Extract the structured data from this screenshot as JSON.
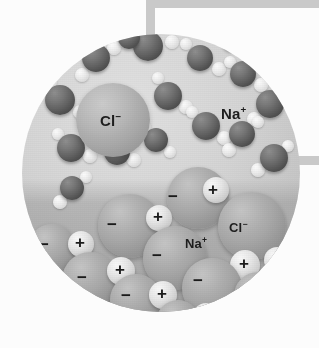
{
  "figure": {
    "kind": "molecular-illustration",
    "background_color": "#ffffff",
    "circle": {
      "fill_color": "#d6d6d3",
      "cx": 161,
      "cy": 173,
      "r": 139
    }
  },
  "connectors": [
    {
      "name": "top-vertical-stem",
      "color": "#c9c9c9"
    },
    {
      "name": "top-horizontal-bar",
      "color": "#c9c9c9"
    },
    {
      "name": "right-tab",
      "color": "#c9c9c9"
    }
  ],
  "labels": [
    {
      "id": "cl-solvated",
      "species": "Cl",
      "charge": "−",
      "text": "Cl",
      "sup": "−",
      "x": 113,
      "y": 120,
      "size": "big",
      "region": "solution"
    },
    {
      "id": "na-solvated",
      "species": "Na",
      "charge": "+",
      "text": "Na",
      "sup": "+",
      "x": 234,
      "y": 113,
      "size": "big",
      "region": "solution"
    },
    {
      "id": "cl-crystal",
      "species": "Cl",
      "charge": "−",
      "text": "Cl",
      "sup": "−",
      "x": 240,
      "y": 228,
      "size": "mid",
      "region": "crystal"
    },
    {
      "id": "na-crystal",
      "species": "Na",
      "charge": "+",
      "text": "Na",
      "sup": "+",
      "x": 196,
      "y": 244,
      "size": "mid",
      "region": "crystal"
    }
  ],
  "charge_marks": [
    {
      "sign": "−",
      "x": 173,
      "y": 197
    },
    {
      "sign": "+",
      "x": 213,
      "y": 190
    },
    {
      "sign": "−",
      "x": 112,
      "y": 225
    },
    {
      "sign": "+",
      "x": 158,
      "y": 217
    },
    {
      "sign": "−",
      "x": 44,
      "y": 245
    },
    {
      "sign": "+",
      "x": 80,
      "y": 243
    },
    {
      "sign": "−",
      "x": 157,
      "y": 256
    },
    {
      "sign": "+",
      "x": 244,
      "y": 264
    },
    {
      "sign": "+",
      "x": 277,
      "y": 259
    },
    {
      "sign": "−",
      "x": 82,
      "y": 278
    },
    {
      "sign": "+",
      "x": 120,
      "y": 270
    },
    {
      "sign": "−",
      "x": 198,
      "y": 281
    },
    {
      "sign": "−",
      "x": 126,
      "y": 296
    },
    {
      "sign": "+",
      "x": 162,
      "y": 294
    },
    {
      "sign": "−",
      "x": 230,
      "y": 303
    },
    {
      "sign": "−",
      "x": 174,
      "y": 320
    },
    {
      "sign": "+",
      "x": 205,
      "y": 315
    }
  ],
  "water_molecules": [
    {
      "ox_x": 148,
      "ox_y": 46,
      "ox_r": 15,
      "h": [
        {
          "x": 172,
          "y": 42,
          "r": 7
        },
        {
          "x": 140,
          "y": 31,
          "r": 7
        }
      ]
    },
    {
      "ox_x": 96,
      "ox_y": 58,
      "ox_r": 14,
      "h": [
        {
          "x": 114,
          "y": 48,
          "r": 7
        },
        {
          "x": 82,
          "y": 75,
          "r": 7
        }
      ]
    },
    {
      "ox_x": 200,
      "ox_y": 58,
      "ox_r": 13,
      "h": [
        {
          "x": 219,
          "y": 69,
          "r": 7
        },
        {
          "x": 186,
          "y": 44,
          "r": 6
        }
      ]
    },
    {
      "ox_x": 243,
      "ox_y": 74,
      "ox_r": 13,
      "h": [
        {
          "x": 261,
          "y": 85,
          "r": 7
        },
        {
          "x": 230,
          "y": 62,
          "r": 6
        }
      ]
    },
    {
      "ox_x": 60,
      "ox_y": 100,
      "ox_r": 15,
      "h": [
        {
          "x": 80,
          "y": 112,
          "r": 7
        },
        {
          "x": 50,
          "y": 82,
          "r": 7
        }
      ]
    },
    {
      "ox_x": 168,
      "ox_y": 96,
      "ox_r": 14,
      "h": [
        {
          "x": 186,
          "y": 107,
          "r": 7
        },
        {
          "x": 158,
          "y": 78,
          "r": 6
        }
      ]
    },
    {
      "ox_x": 270,
      "ox_y": 104,
      "ox_r": 14,
      "h": [
        {
          "x": 254,
          "y": 119,
          "r": 7
        },
        {
          "x": 283,
          "y": 88,
          "r": 6
        }
      ]
    },
    {
      "ox_x": 206,
      "ox_y": 126,
      "ox_r": 14,
      "h": [
        {
          "x": 224,
          "y": 138,
          "r": 7
        },
        {
          "x": 192,
          "y": 112,
          "r": 6
        }
      ]
    },
    {
      "ox_x": 242,
      "ox_y": 134,
      "ox_r": 13,
      "h": [
        {
          "x": 229,
          "y": 150,
          "r": 7
        },
        {
          "x": 258,
          "y": 122,
          "r": 6
        }
      ]
    },
    {
      "ox_x": 71,
      "ox_y": 148,
      "ox_r": 14,
      "h": [
        {
          "x": 90,
          "y": 156,
          "r": 7
        },
        {
          "x": 58,
          "y": 134,
          "r": 6
        }
      ]
    },
    {
      "ox_x": 117,
      "ox_y": 152,
      "ox_r": 13,
      "h": [
        {
          "x": 134,
          "y": 160,
          "r": 7
        },
        {
          "x": 104,
          "y": 138,
          "r": 6
        }
      ]
    },
    {
      "ox_x": 156,
      "ox_y": 140,
      "ox_r": 12,
      "h": [
        {
          "x": 170,
          "y": 152,
          "r": 6
        },
        {
          "x": 145,
          "y": 127,
          "r": 6
        }
      ]
    },
    {
      "ox_x": 274,
      "ox_y": 158,
      "ox_r": 14,
      "h": [
        {
          "x": 258,
          "y": 170,
          "r": 7
        },
        {
          "x": 288,
          "y": 146,
          "r": 6
        }
      ]
    },
    {
      "ox_x": 72,
      "ox_y": 188,
      "ox_r": 12,
      "h": [
        {
          "x": 60,
          "y": 202,
          "r": 7
        },
        {
          "x": 86,
          "y": 177,
          "r": 6
        }
      ]
    },
    {
      "ox_x": 129,
      "ox_y": 38,
      "ox_r": 11,
      "h": [
        {
          "x": 118,
          "y": 29,
          "r": 6
        }
      ]
    },
    {
      "ox_x": 232,
      "ox_y": 40,
      "ox_r": 11,
      "h": [
        {
          "x": 246,
          "y": 49,
          "r": 6
        }
      ]
    }
  ],
  "solvated_ions": [
    {
      "id": "cl-big-sphere",
      "x": 113,
      "y": 120,
      "r": 37,
      "kind": "chloride"
    }
  ],
  "lattice_spheres": [
    {
      "kind": "anion",
      "x": 198,
      "y": 198,
      "r": 31
    },
    {
      "kind": "cation",
      "x": 216,
      "y": 190,
      "r": 13
    },
    {
      "kind": "anion",
      "x": 130,
      "y": 226,
      "r": 32
    },
    {
      "kind": "cation",
      "x": 159,
      "y": 218,
      "r": 13
    },
    {
      "kind": "anion",
      "x": 252,
      "y": 226,
      "r": 34
    },
    {
      "kind": "anion",
      "x": 52,
      "y": 248,
      "r": 24
    },
    {
      "kind": "cation",
      "x": 81,
      "y": 244,
      "r": 13
    },
    {
      "kind": "anion",
      "x": 175,
      "y": 258,
      "r": 32
    },
    {
      "kind": "cation",
      "x": 245,
      "y": 265,
      "r": 15
    },
    {
      "kind": "cation",
      "x": 277,
      "y": 260,
      "r": 13
    },
    {
      "kind": "anion",
      "x": 90,
      "y": 280,
      "r": 28
    },
    {
      "kind": "cation",
      "x": 121,
      "y": 271,
      "r": 14
    },
    {
      "kind": "anion",
      "x": 212,
      "y": 288,
      "r": 30
    },
    {
      "kind": "anion",
      "x": 136,
      "y": 300,
      "r": 26
    },
    {
      "kind": "cation",
      "x": 163,
      "y": 295,
      "r": 14
    },
    {
      "kind": "anion",
      "x": 258,
      "y": 296,
      "r": 24
    },
    {
      "kind": "cation",
      "x": 206,
      "y": 316,
      "r": 13
    },
    {
      "kind": "anion",
      "x": 178,
      "y": 322,
      "r": 22
    }
  ],
  "caption": {
    "text": "",
    "cropped": true
  }
}
